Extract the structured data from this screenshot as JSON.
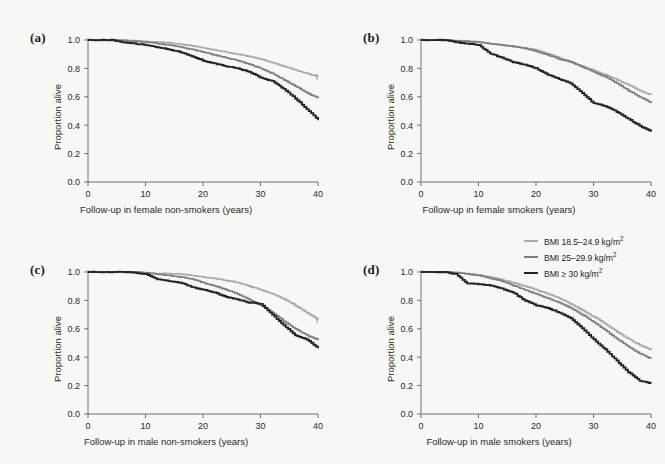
{
  "figure": {
    "background_color": "#f7f7f5",
    "panel_labels": [
      "(a)",
      "(b)",
      "(c)",
      "(d)"
    ]
  },
  "legend": {
    "position": "top-right of panel d",
    "entries": [
      {
        "label_prefix": "BMI ",
        "label_main": "18.5–24.9 kg/m",
        "sup": "2",
        "color": "#a9a9a9",
        "name": "normal-weight"
      },
      {
        "label_prefix": "BMI ",
        "label_main": "25–29.9 kg/m",
        "sup": "2",
        "color": "#7d7d7d",
        "name": "overweight"
      },
      {
        "label_prefix": "BMI ",
        "label_main": "≥ 30 kg/m",
        "sup": "2",
        "color": "#242424",
        "name": "obese"
      }
    ]
  },
  "axes": {
    "ylabel": "Proportion alive",
    "yticks": [
      "0.0",
      "0.2",
      "0.4",
      "0.6",
      "0.8",
      "1.0"
    ],
    "ytick_values": [
      0.0,
      0.2,
      0.4,
      0.6,
      0.8,
      1.0
    ],
    "ylim": [
      0,
      1.0
    ],
    "xticks": [
      "0",
      "10",
      "20",
      "30",
      "40"
    ],
    "xtick_values": [
      0,
      10,
      20,
      30,
      40
    ],
    "xlim": [
      0,
      40
    ],
    "grid": false
  },
  "chart_data": [
    {
      "type": "line",
      "panel": "(a)",
      "title": "",
      "xlabel": "Follow-up in female non-smokers (years)",
      "ylabel": "Proportion alive",
      "xlim": [
        0,
        40
      ],
      "ylim": [
        0,
        1.0
      ],
      "grid": false,
      "legend": "shared",
      "x": [
        0,
        2,
        4,
        6,
        8,
        10,
        12,
        14,
        16,
        18,
        20,
        22,
        24,
        26,
        28,
        30,
        32,
        34,
        36,
        38,
        40
      ],
      "series": [
        {
          "name": "BMI 18.5–24.9 kg/m2",
          "color": "#a9a9a9",
          "values": [
            1.0,
            1.0,
            1.0,
            1.0,
            0.995,
            0.99,
            0.985,
            0.98,
            0.97,
            0.96,
            0.945,
            0.93,
            0.915,
            0.9,
            0.885,
            0.865,
            0.84,
            0.815,
            0.79,
            0.765,
            0.74
          ]
        },
        {
          "name": "BMI 25–29.9 kg/m2",
          "color": "#7d7d7d",
          "values": [
            1.0,
            1.0,
            1.0,
            0.995,
            0.99,
            0.985,
            0.975,
            0.965,
            0.95,
            0.935,
            0.915,
            0.895,
            0.875,
            0.855,
            0.83,
            0.8,
            0.765,
            0.72,
            0.675,
            0.63,
            0.59
          ]
        },
        {
          "name": "BMI ≥ 30 kg/m2",
          "color": "#242424",
          "values": [
            1.0,
            1.0,
            1.0,
            0.985,
            0.975,
            0.965,
            0.95,
            0.935,
            0.915,
            0.885,
            0.855,
            0.835,
            0.815,
            0.8,
            0.775,
            0.735,
            0.71,
            0.655,
            0.59,
            0.515,
            0.435
          ]
        }
      ]
    },
    {
      "type": "line",
      "panel": "(b)",
      "title": "",
      "xlabel": "Follow-up in female smokers (years)",
      "ylabel": "Proportion alive",
      "xlim": [
        0,
        40
      ],
      "ylim": [
        0,
        1.0
      ],
      "grid": false,
      "legend": "shared",
      "x": [
        0,
        2,
        4,
        6,
        8,
        10,
        12,
        14,
        16,
        18,
        20,
        22,
        24,
        26,
        28,
        30,
        32,
        34,
        36,
        38,
        40
      ],
      "series": [
        {
          "name": "BMI 18.5–24.9 kg/m2",
          "color": "#a9a9a9",
          "values": [
            1.0,
            1.0,
            1.0,
            0.995,
            0.99,
            0.985,
            0.975,
            0.965,
            0.955,
            0.945,
            0.93,
            0.905,
            0.875,
            0.845,
            0.815,
            0.785,
            0.755,
            0.72,
            0.685,
            0.645,
            0.61
          ]
        },
        {
          "name": "BMI 25–29.9 kg/m2",
          "color": "#7d7d7d",
          "values": [
            1.0,
            1.0,
            1.0,
            0.995,
            0.99,
            0.985,
            0.975,
            0.965,
            0.955,
            0.94,
            0.92,
            0.895,
            0.865,
            0.845,
            0.81,
            0.775,
            0.74,
            0.695,
            0.645,
            0.6,
            0.555
          ]
        },
        {
          "name": "BMI ≥ 30 kg/m2",
          "color": "#242424",
          "values": [
            1.0,
            1.0,
            1.0,
            0.985,
            0.975,
            0.965,
            0.905,
            0.875,
            0.845,
            0.825,
            0.8,
            0.755,
            0.725,
            0.695,
            0.625,
            0.555,
            0.535,
            0.495,
            0.445,
            0.395,
            0.355
          ]
        }
      ]
    },
    {
      "type": "line",
      "panel": "(c)",
      "title": "",
      "xlabel": "Follow-up in male non-smokers (years)",
      "ylabel": "Proportion alive",
      "xlim": [
        0,
        40
      ],
      "ylim": [
        0,
        1.0
      ],
      "grid": false,
      "legend": "shared",
      "x": [
        0,
        2,
        4,
        6,
        8,
        10,
        12,
        14,
        16,
        18,
        20,
        22,
        24,
        26,
        28,
        30,
        32,
        34,
        36,
        38,
        40
      ],
      "series": [
        {
          "name": "BMI 18.5–24.9 kg/m2",
          "color": "#a9a9a9",
          "values": [
            1.0,
            1.0,
            1.0,
            1.0,
            1.0,
            0.995,
            0.99,
            0.99,
            0.985,
            0.975,
            0.965,
            0.955,
            0.94,
            0.925,
            0.9,
            0.875,
            0.845,
            0.81,
            0.765,
            0.715,
            0.66
          ]
        },
        {
          "name": "BMI 25–29.9 kg/m2",
          "color": "#7d7d7d",
          "values": [
            1.0,
            1.0,
            1.0,
            1.0,
            1.0,
            0.995,
            0.985,
            0.975,
            0.965,
            0.95,
            0.925,
            0.9,
            0.875,
            0.845,
            0.805,
            0.765,
            0.715,
            0.655,
            0.6,
            0.555,
            0.52
          ]
        },
        {
          "name": "BMI ≥ 30 kg/m2",
          "color": "#242424",
          "values": [
            1.0,
            1.0,
            1.0,
            1.0,
            0.995,
            0.985,
            0.95,
            0.935,
            0.925,
            0.895,
            0.875,
            0.855,
            0.825,
            0.805,
            0.785,
            0.775,
            0.7,
            0.625,
            0.555,
            0.525,
            0.465
          ]
        }
      ]
    },
    {
      "type": "line",
      "panel": "(d)",
      "title": "",
      "xlabel": "Follow-up in male smokers (years)",
      "ylabel": "Proportion alive",
      "xlim": [
        0,
        40
      ],
      "ylim": [
        0,
        1.0
      ],
      "grid": false,
      "legend": "shown",
      "x": [
        0,
        2,
        4,
        6,
        8,
        10,
        12,
        14,
        16,
        18,
        20,
        22,
        24,
        26,
        28,
        30,
        32,
        34,
        36,
        38,
        40
      ],
      "series": [
        {
          "name": "BMI 18.5–24.9 kg/m2",
          "color": "#a9a9a9",
          "values": [
            1.0,
            1.0,
            1.0,
            0.995,
            0.99,
            0.98,
            0.965,
            0.945,
            0.925,
            0.9,
            0.875,
            0.845,
            0.815,
            0.775,
            0.73,
            0.685,
            0.635,
            0.58,
            0.53,
            0.485,
            0.45
          ]
        },
        {
          "name": "BMI 25–29.9 kg/m2",
          "color": "#7d7d7d",
          "values": [
            1.0,
            1.0,
            1.0,
            0.995,
            0.985,
            0.975,
            0.955,
            0.935,
            0.905,
            0.875,
            0.845,
            0.815,
            0.785,
            0.745,
            0.7,
            0.645,
            0.59,
            0.53,
            0.475,
            0.425,
            0.39
          ]
        },
        {
          "name": "BMI ≥ 30 kg/m2",
          "color": "#242424",
          "values": [
            1.0,
            1.0,
            1.0,
            0.985,
            0.92,
            0.915,
            0.905,
            0.885,
            0.855,
            0.8,
            0.765,
            0.745,
            0.715,
            0.675,
            0.605,
            0.525,
            0.455,
            0.375,
            0.295,
            0.235,
            0.215
          ]
        }
      ]
    }
  ]
}
